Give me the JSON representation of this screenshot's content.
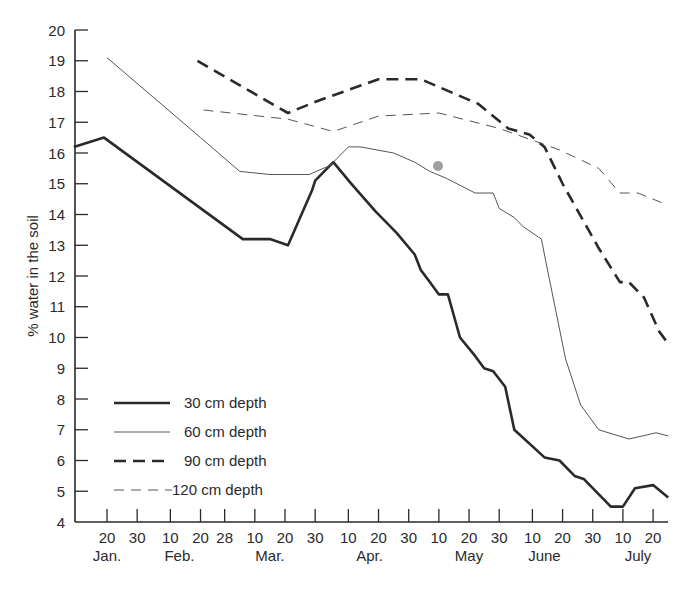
{
  "chart_data": {
    "type": "line",
    "title": "",
    "xlabel": "",
    "ylabel": "% water in the soil",
    "ylim": [
      4,
      20
    ],
    "y_ticks": [
      4,
      5,
      6,
      7,
      8,
      9,
      10,
      11,
      12,
      13,
      14,
      15,
      16,
      17,
      18,
      19,
      20
    ],
    "x_unit": "day of year",
    "xlim": [
      9,
      206
    ],
    "x_ticks": [
      {
        "day": 20,
        "label": "20"
      },
      {
        "day": 30,
        "label": "30"
      },
      {
        "day": 41,
        "label": "10"
      },
      {
        "day": 51,
        "label": "20"
      },
      {
        "day": 59,
        "label": "28"
      },
      {
        "day": 69,
        "label": "10"
      },
      {
        "day": 79,
        "label": "20"
      },
      {
        "day": 89,
        "label": "30"
      },
      {
        "day": 100,
        "label": "10"
      },
      {
        "day": 110,
        "label": "20"
      },
      {
        "day": 120,
        "label": "30"
      },
      {
        "day": 130,
        "label": "10"
      },
      {
        "day": 140,
        "label": "20"
      },
      {
        "day": 150,
        "label": "30"
      },
      {
        "day": 161,
        "label": "10"
      },
      {
        "day": 171,
        "label": "20"
      },
      {
        "day": 181,
        "label": "30"
      },
      {
        "day": 191,
        "label": "10"
      },
      {
        "day": 201,
        "label": "20"
      }
    ],
    "month_labels": [
      {
        "day": 20,
        "label": "Jan."
      },
      {
        "day": 44,
        "label": "Feb."
      },
      {
        "day": 74,
        "label": "Mar."
      },
      {
        "day": 107,
        "label": "Apr."
      },
      {
        "day": 140,
        "label": "May"
      },
      {
        "day": 165,
        "label": "June"
      },
      {
        "day": 196,
        "label": "July"
      }
    ],
    "grid": false,
    "legend_position": "lower-left inside",
    "series": [
      {
        "name": "30 cm depth",
        "style": "solid-thick",
        "points": [
          [
            9,
            16.2
          ],
          [
            19,
            16.5
          ],
          [
            65,
            13.2
          ],
          [
            74,
            13.2
          ],
          [
            80,
            13.0
          ],
          [
            88,
            14.8
          ],
          [
            89,
            15.1
          ],
          [
            95,
            15.7
          ],
          [
            101,
            15.0
          ],
          [
            109,
            14.1
          ],
          [
            116,
            13.4
          ],
          [
            122,
            12.7
          ],
          [
            124,
            12.2
          ],
          [
            127,
            11.8
          ],
          [
            130,
            11.4
          ],
          [
            133,
            11.4
          ],
          [
            137,
            10.0
          ],
          [
            142,
            9.4
          ],
          [
            145,
            9.0
          ],
          [
            148,
            8.9
          ],
          [
            152,
            8.4
          ],
          [
            155,
            7.0
          ],
          [
            165,
            6.1
          ],
          [
            170,
            6.0
          ],
          [
            175,
            5.5
          ],
          [
            178,
            5.4
          ],
          [
            187,
            4.5
          ],
          [
            191,
            4.5
          ],
          [
            195,
            5.1
          ],
          [
            201,
            5.2
          ],
          [
            206,
            4.8
          ]
        ]
      },
      {
        "name": "60 cm depth",
        "style": "solid-thin",
        "points": [
          [
            20,
            19.1
          ],
          [
            51,
            16.5
          ],
          [
            64,
            15.4
          ],
          [
            74,
            15.3
          ],
          [
            87,
            15.3
          ],
          [
            94,
            15.6
          ],
          [
            100,
            16.2
          ],
          [
            104,
            16.2
          ],
          [
            115,
            16.0
          ],
          [
            122,
            15.7
          ],
          [
            127,
            15.4
          ],
          [
            132,
            15.2
          ],
          [
            138,
            14.9
          ],
          [
            142,
            14.7
          ],
          [
            148,
            14.7
          ],
          [
            150,
            14.2
          ],
          [
            155,
            13.9
          ],
          [
            158,
            13.6
          ],
          [
            164,
            13.2
          ],
          [
            166,
            12.2
          ],
          [
            172,
            9.3
          ],
          [
            177,
            7.8
          ],
          [
            183,
            7.0
          ],
          [
            193,
            6.7
          ],
          [
            202,
            6.9
          ],
          [
            206,
            6.8
          ]
        ]
      },
      {
        "name": "90 cm depth",
        "style": "dashed-thick",
        "points": [
          [
            50,
            19.0
          ],
          [
            80,
            17.3
          ],
          [
            90,
            17.7
          ],
          [
            110,
            18.4
          ],
          [
            124,
            18.4
          ],
          [
            143,
            17.6
          ],
          [
            153,
            16.8
          ],
          [
            160,
            16.6
          ],
          [
            165,
            16.2
          ],
          [
            171,
            15.0
          ],
          [
            183,
            12.9
          ],
          [
            190,
            11.8
          ],
          [
            193,
            11.8
          ],
          [
            198,
            11.3
          ],
          [
            203,
            10.2
          ],
          [
            206,
            9.8
          ]
        ]
      },
      {
        "name": "120 cm depth",
        "style": "dashed-thin",
        "points": [
          [
            52,
            17.4
          ],
          [
            80,
            17.1
          ],
          [
            95,
            16.7
          ],
          [
            110,
            17.2
          ],
          [
            130,
            17.3
          ],
          [
            150,
            16.8
          ],
          [
            170,
            16.1
          ],
          [
            183,
            15.5
          ],
          [
            190,
            14.7
          ],
          [
            196,
            14.7
          ],
          [
            206,
            14.3
          ]
        ]
      }
    ]
  },
  "legend": {
    "items": [
      {
        "label": "30 cm depth"
      },
      {
        "label": "60 cm depth"
      },
      {
        "label": "90 cm depth"
      },
      {
        "label": "120 cm depth"
      }
    ]
  },
  "colors": {
    "ink": "#2a2a2a",
    "thin_ink": "#555555",
    "smudge": "#888888"
  }
}
